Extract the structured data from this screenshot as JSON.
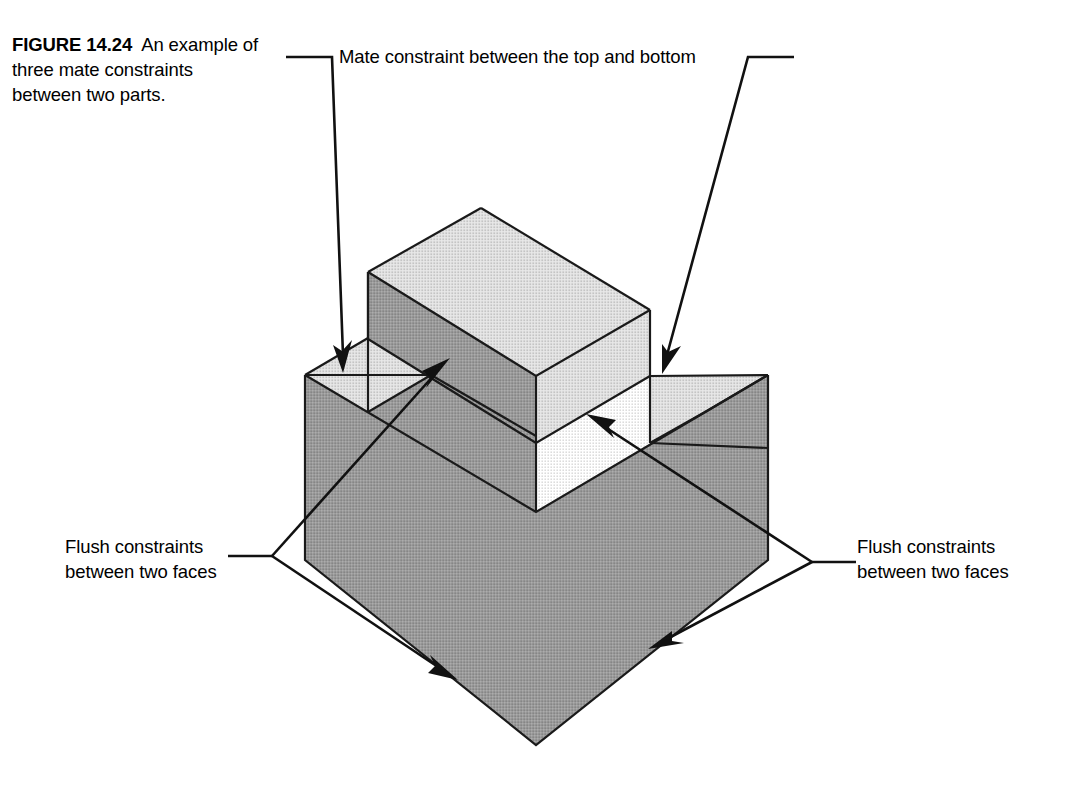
{
  "figure": {
    "number": "FIGURE 14.24",
    "caption_text": "An example of three mate constraints between two parts.",
    "caption_line_1": "An",
    "caption_line_2": "example of three mate",
    "caption_line_3": "constraints between two",
    "caption_line_4": "parts."
  },
  "annotations": {
    "mate": {
      "text": "Mate constraint between the top and bottom",
      "position": "top-center",
      "leader_count": 2
    },
    "flush_left": {
      "line_1": "Flush constraints",
      "line_2": "between two faces",
      "position": "left",
      "leader_count": 2
    },
    "flush_right": {
      "line_1": "Flush constraints",
      "line_2": "between two faces",
      "position": "right",
      "leader_count": 2
    }
  },
  "colors": {
    "top_face": "#e3e3e3",
    "side_face": "#9b9b9b",
    "outline": "#1a1a1a",
    "leader": "#111111",
    "background": "#ffffff",
    "text": "#000000"
  },
  "model": {
    "description": "Isometric assembly of two parts: a lower block with a rectangular notch in its top face, and an upper rib block seated in the notch.",
    "parts": [
      "lower block with notch",
      "upper rib block"
    ],
    "constraint_count": 3
  }
}
